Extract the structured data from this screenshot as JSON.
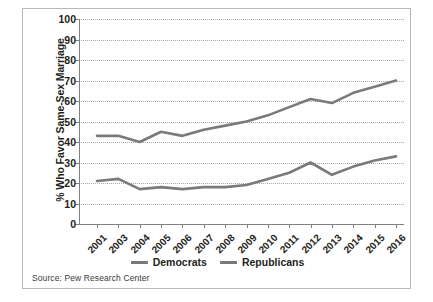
{
  "chart_data": {
    "type": "line",
    "title": "",
    "xlabel": "",
    "ylabel": "% Who Favor Same-Sex Marriage",
    "ylim": [
      0,
      100
    ],
    "ytick_step": 10,
    "yticks": [
      0,
      10,
      20,
      30,
      40,
      50,
      60,
      70,
      80,
      90,
      100
    ],
    "grid": true,
    "grid_style": "dotted-horizontal",
    "legend_position": "bottom-center",
    "categories": [
      "2001",
      "2003",
      "2004",
      "2005",
      "2006",
      "2007",
      "2008",
      "2009",
      "2010",
      "2011",
      "2012",
      "2013",
      "2014",
      "2015",
      "2016"
    ],
    "series": [
      {
        "name": "Democrats",
        "color": "#7a7a7a",
        "values": [
          43,
          43,
          40,
          45,
          43,
          46,
          48,
          50,
          53,
          57,
          61,
          59,
          64,
          67,
          70
        ]
      },
      {
        "name": "Republicans",
        "color": "#7a7a7a",
        "values": [
          21,
          22,
          17,
          18,
          17,
          18,
          18,
          19,
          22,
          25,
          30,
          24,
          28,
          31,
          33
        ]
      }
    ],
    "source": "Source: Pew Research Center"
  },
  "legend": {
    "items": [
      {
        "label": "Democrats"
      },
      {
        "label": "Republicans"
      }
    ]
  },
  "axis": {
    "y_title": "% Who Favor Same-Sex Marriage"
  },
  "footer": {
    "source": "Source: Pew Research Center"
  }
}
